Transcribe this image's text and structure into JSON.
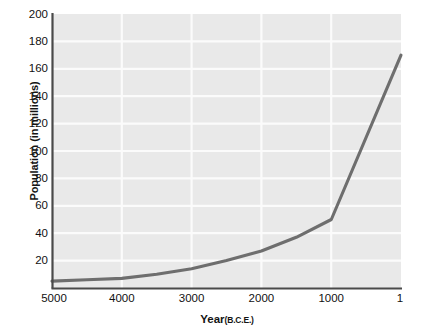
{
  "chart_data": {
    "type": "line",
    "title": "",
    "xlabel": "Year",
    "xlabel_sub": "(B.C.E.)",
    "ylabel": "Population (in millions)",
    "x_tick_labels": [
      "5000",
      "4000",
      "3000",
      "2000",
      "1000",
      "1"
    ],
    "y_tick_labels": [
      "20",
      "40",
      "60",
      "80",
      "100",
      "120",
      "140",
      "160",
      "180",
      "200"
    ],
    "x": [
      5000,
      4000,
      3000,
      2000,
      1000,
      1
    ],
    "values": [
      5,
      7,
      14,
      27,
      50,
      170
    ],
    "xlim": [
      5000,
      1
    ],
    "ylim": [
      0,
      200
    ],
    "x_inverted": true,
    "grid": true,
    "legend": "none",
    "series": [
      {
        "name": "World population",
        "x": [
          5000,
          4500,
          4000,
          3500,
          3000,
          2500,
          2000,
          1500,
          1000,
          1
        ],
        "values": [
          5,
          6,
          7,
          10,
          14,
          20,
          27,
          37,
          50,
          170
        ]
      }
    ],
    "colors": {
      "line": "#6e6e6e",
      "plot_background": "#e9e9e9",
      "gridline": "#fbfbfb",
      "axis": "#4a4a4a",
      "text": "#141414",
      "page_background": "#ffffff"
    }
  }
}
